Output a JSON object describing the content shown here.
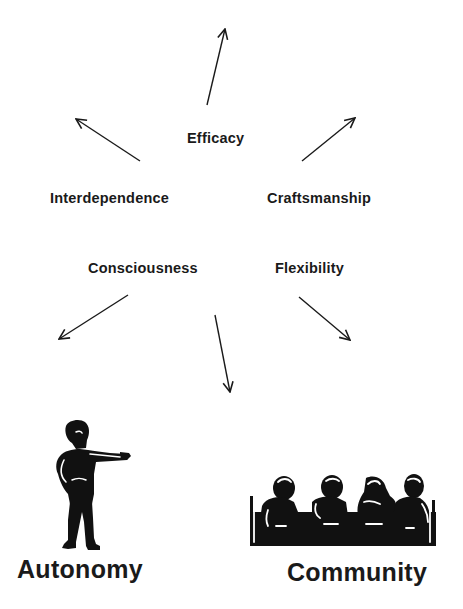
{
  "diagram": {
    "type": "radial-arrows-concept-map",
    "background_color": "#ffffff",
    "ink_color": "#1a1a1a",
    "states_of_mind": [
      {
        "id": "efficacy",
        "label": "Efficacy"
      },
      {
        "id": "interdependence",
        "label": "Interdependence"
      },
      {
        "id": "craftsmanship",
        "label": "Craftsmanship"
      },
      {
        "id": "consciousness",
        "label": "Consciousness"
      },
      {
        "id": "flexibility",
        "label": "Flexibility"
      }
    ],
    "arrows": [
      {
        "id": "arrow-up",
        "direction": "up"
      },
      {
        "id": "arrow-up-left",
        "direction": "up-left"
      },
      {
        "id": "arrow-up-right",
        "direction": "up-right"
      },
      {
        "id": "arrow-down-left",
        "direction": "down-left"
      },
      {
        "id": "arrow-down",
        "direction": "down"
      },
      {
        "id": "arrow-down-right",
        "direction": "down-right"
      }
    ],
    "poles": [
      {
        "id": "autonomy",
        "label": "Autonomy",
        "icon": "pointing-person-icon"
      },
      {
        "id": "community",
        "label": "Community",
        "icon": "people-at-table-icon"
      }
    ]
  }
}
